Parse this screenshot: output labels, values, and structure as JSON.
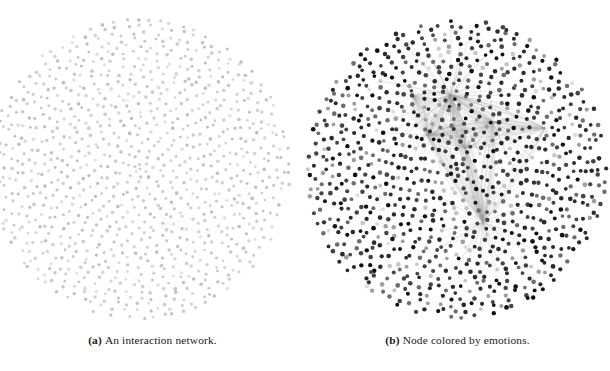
{
  "figure": {
    "background_color": "#ffffff",
    "subfigures": [
      {
        "id": "a",
        "label": "(a)",
        "caption": "An interaction network.",
        "node_color": "#c9c9c9",
        "edge_color": "#d8d8d8",
        "network": {
          "layout": "radial-disc",
          "node_count": 780,
          "center_x": 140,
          "center_y": 169,
          "radius": 149,
          "node_radius": 1.6,
          "rings": 23,
          "hubs": [
            {
              "x": 127,
              "y": 100,
              "strength": 0.18,
              "spokes": 26
            },
            {
              "x": 164,
              "y": 223,
              "strength": 0.22,
              "spokes": 30
            }
          ],
          "gray_levels": [
            "#cfcfcf",
            "#c8c8c8",
            "#d5d5d5",
            "#c0c0c0",
            "#dcdcdc"
          ]
        }
      },
      {
        "id": "b",
        "label": "(b)",
        "caption": "Node colored by emotions.",
        "node_color": "#3a3a3a",
        "edge_color": "#9a9a9a",
        "network": {
          "layout": "radial-disc",
          "node_count": 780,
          "center_x": 152,
          "center_y": 169,
          "radius": 149,
          "node_radius": 2.1,
          "rings": 23,
          "hubs": [
            {
              "x": 145,
              "y": 95,
              "strength": 1.0,
              "spokes": 90
            },
            {
              "x": 178,
              "y": 222,
              "strength": 0.85,
              "spokes": 70
            },
            {
              "x": 188,
              "y": 122,
              "strength": 0.6,
              "spokes": 46
            },
            {
              "x": 122,
              "y": 135,
              "strength": 0.5,
              "spokes": 40
            },
            {
              "x": 160,
              "y": 148,
              "strength": 0.45,
              "spokes": 34
            },
            {
              "x": 108,
              "y": 96,
              "strength": 0.3,
              "spokes": 22
            },
            {
              "x": 240,
              "y": 128,
              "strength": 0.28,
              "spokes": 20
            },
            {
              "x": 75,
              "y": 197,
              "strength": 0.2,
              "spokes": 16
            }
          ],
          "gray_levels": [
            "#111111",
            "#2b2b2b",
            "#444444",
            "#6d6d6d",
            "#9e9e9e",
            "#c6c6c6",
            "#dddddd"
          ]
        }
      }
    ]
  }
}
